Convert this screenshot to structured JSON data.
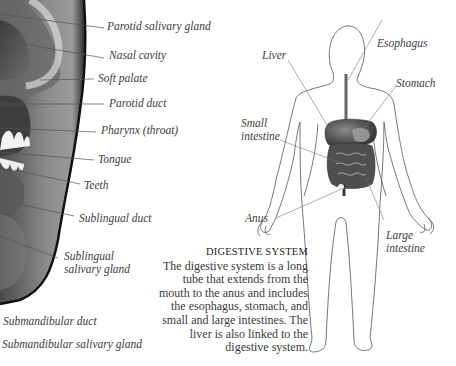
{
  "mouth_diagram": {
    "labels": {
      "parotid_salivary_gland": "Parotid salivary gland",
      "nasal_cavity": "Nasal cavity",
      "soft_palate": "Soft palate",
      "parotid_duct": "Parotid duct",
      "pharynx": "Pharynx (throat)",
      "tongue": "Tongue",
      "teeth": "Teeth",
      "sublingual_duct": "Sublingual duct",
      "sublingual_salivary_gland_line1": "Sublingual",
      "sublingual_salivary_gland_line2": "salivary gland",
      "submandibular_duct": "Submandibular duct",
      "submandibular_salivary_gland": "Submandibular salivary gland"
    }
  },
  "body_diagram": {
    "labels": {
      "liver": "Liver",
      "esophagus": "Esophagus",
      "stomach": "Stomach",
      "small_intestine_line1": "Small",
      "small_intestine_line2": "intestine",
      "anus": "Anus",
      "large_intestine_line1": "Large",
      "large_intestine_line2": "intestine"
    }
  },
  "caption": {
    "title": "DIGESTIVE SYSTEM",
    "body": "The digestive system is a long tube that extends from the mouth to the anus and includes the esophagus, stomach, and small and large intestines. The liver is also linked to the digestive system."
  }
}
